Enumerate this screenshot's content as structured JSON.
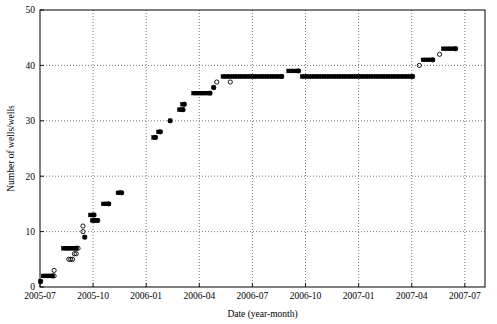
{
  "chart_data": {
    "type": "scatter",
    "title": "",
    "xlabel": "Date (year-month)",
    "ylabel": "Number of wells/wells",
    "ylim": [
      0,
      50
    ],
    "yticks": [
      0,
      10,
      20,
      30,
      40,
      50
    ],
    "ytick_labels": [
      "0",
      "10",
      "20",
      "30",
      "40",
      "50"
    ],
    "xlim": [
      "2005-07",
      "2007-08"
    ],
    "xticks": [
      "2005-07",
      "2005-10",
      "2006-01",
      "2006-04",
      "2006-07",
      "2006-10",
      "2007-01",
      "2007-04",
      "2007-07"
    ],
    "xtick_labels": [
      "2005-07",
      "2005-10",
      "2006-01",
      "2006-04",
      "2006-07",
      "2006-10",
      "2007-01",
      "2007-04",
      "2007-07"
    ],
    "grid": true,
    "grid_style": "dotted",
    "marker_filled": "square",
    "marker_open": "circle",
    "series": [
      {
        "name": "wells-filled-square",
        "marker": "filled-square",
        "color": "#000000",
        "points": [
          {
            "x": 0.2,
            "y": 1
          },
          {
            "x": 1.0,
            "y": 2
          },
          {
            "x": 1.6,
            "y": 2
          },
          {
            "x": 2.2,
            "y": 2
          },
          {
            "x": 2.8,
            "y": 2
          },
          {
            "x": 3.4,
            "y": 2
          },
          {
            "x": 4.0,
            "y": 2
          },
          {
            "x": 7.6,
            "y": 7
          },
          {
            "x": 8.2,
            "y": 7
          },
          {
            "x": 8.8,
            "y": 7
          },
          {
            "x": 9.4,
            "y": 7
          },
          {
            "x": 10.0,
            "y": 7
          },
          {
            "x": 10.6,
            "y": 7
          },
          {
            "x": 11.2,
            "y": 7
          },
          {
            "x": 11.8,
            "y": 7
          },
          {
            "x": 14.6,
            "y": 9
          },
          {
            "x": 17.0,
            "y": 12
          },
          {
            "x": 17.6,
            "y": 12
          },
          {
            "x": 18.2,
            "y": 12
          },
          {
            "x": 18.8,
            "y": 12
          },
          {
            "x": 16.4,
            "y": 13
          },
          {
            "x": 17.0,
            "y": 13
          },
          {
            "x": 17.6,
            "y": 13
          },
          {
            "x": 20.6,
            "y": 15
          },
          {
            "x": 21.2,
            "y": 15
          },
          {
            "x": 21.8,
            "y": 15
          },
          {
            "x": 22.4,
            "y": 15
          },
          {
            "x": 25.4,
            "y": 17
          },
          {
            "x": 26.0,
            "y": 17
          },
          {
            "x": 26.6,
            "y": 17
          },
          {
            "x": 37.0,
            "y": 27
          },
          {
            "x": 37.6,
            "y": 27
          },
          {
            "x": 38.6,
            "y": 28
          },
          {
            "x": 39.2,
            "y": 28
          },
          {
            "x": 42.4,
            "y": 30
          },
          {
            "x": 45.4,
            "y": 32
          },
          {
            "x": 46.0,
            "y": 32
          },
          {
            "x": 46.6,
            "y": 32
          },
          {
            "x": 46.4,
            "y": 33
          },
          {
            "x": 47.0,
            "y": 33
          },
          {
            "x": 50.0,
            "y": 35
          },
          {
            "x": 50.6,
            "y": 35
          },
          {
            "x": 51.2,
            "y": 35
          },
          {
            "x": 51.8,
            "y": 35
          },
          {
            "x": 52.4,
            "y": 35
          },
          {
            "x": 53.0,
            "y": 35
          },
          {
            "x": 53.6,
            "y": 35
          },
          {
            "x": 54.2,
            "y": 35
          },
          {
            "x": 54.8,
            "y": 35
          },
          {
            "x": 55.4,
            "y": 35
          },
          {
            "x": 56.6,
            "y": 36
          },
          {
            "x": 59.6,
            "y": 38
          },
          {
            "x": 60.4,
            "y": 38
          },
          {
            "x": 61.2,
            "y": 38
          },
          {
            "x": 62.0,
            "y": 38
          },
          {
            "x": 62.8,
            "y": 38
          },
          {
            "x": 63.6,
            "y": 38
          },
          {
            "x": 64.4,
            "y": 38
          },
          {
            "x": 65.2,
            "y": 38
          },
          {
            "x": 66.0,
            "y": 38
          },
          {
            "x": 66.8,
            "y": 38
          },
          {
            "x": 67.6,
            "y": 38
          },
          {
            "x": 68.4,
            "y": 38
          },
          {
            "x": 69.2,
            "y": 38
          },
          {
            "x": 70.0,
            "y": 38
          },
          {
            "x": 70.8,
            "y": 38
          },
          {
            "x": 71.6,
            "y": 38
          },
          {
            "x": 72.4,
            "y": 38
          },
          {
            "x": 73.2,
            "y": 38
          },
          {
            "x": 74.0,
            "y": 38
          },
          {
            "x": 74.8,
            "y": 38
          },
          {
            "x": 75.6,
            "y": 38
          },
          {
            "x": 76.4,
            "y": 38
          },
          {
            "x": 77.2,
            "y": 38
          },
          {
            "x": 78.0,
            "y": 38
          },
          {
            "x": 78.8,
            "y": 38
          },
          {
            "x": 81.0,
            "y": 39
          },
          {
            "x": 81.8,
            "y": 39
          },
          {
            "x": 82.6,
            "y": 39
          },
          {
            "x": 83.4,
            "y": 39
          },
          {
            "x": 84.2,
            "y": 39
          },
          {
            "x": 85.4,
            "y": 38
          },
          {
            "x": 86.2,
            "y": 38
          },
          {
            "x": 87.0,
            "y": 38
          },
          {
            "x": 87.8,
            "y": 38
          },
          {
            "x": 88.6,
            "y": 38
          },
          {
            "x": 89.4,
            "y": 38
          },
          {
            "x": 90.2,
            "y": 38
          },
          {
            "x": 91.0,
            "y": 38
          },
          {
            "x": 91.8,
            "y": 38
          },
          {
            "x": 92.6,
            "y": 38
          },
          {
            "x": 93.4,
            "y": 38
          },
          {
            "x": 94.2,
            "y": 38
          },
          {
            "x": 95.0,
            "y": 38
          },
          {
            "x": 95.8,
            "y": 38
          },
          {
            "x": 96.6,
            "y": 38
          },
          {
            "x": 97.4,
            "y": 38
          },
          {
            "x": 98.2,
            "y": 38
          },
          {
            "x": 99.0,
            "y": 38
          },
          {
            "x": 99.8,
            "y": 38
          },
          {
            "x": 100.6,
            "y": 38
          },
          {
            "x": 101.4,
            "y": 38
          },
          {
            "x": 102.2,
            "y": 38
          },
          {
            "x": 103.0,
            "y": 38
          },
          {
            "x": 103.8,
            "y": 38
          },
          {
            "x": 104.6,
            "y": 38
          },
          {
            "x": 105.4,
            "y": 38
          },
          {
            "x": 106.2,
            "y": 38
          },
          {
            "x": 107.0,
            "y": 38
          },
          {
            "x": 107.8,
            "y": 38
          },
          {
            "x": 108.6,
            "y": 38
          },
          {
            "x": 109.4,
            "y": 38
          },
          {
            "x": 110.2,
            "y": 38
          },
          {
            "x": 111.0,
            "y": 38
          },
          {
            "x": 111.8,
            "y": 38
          },
          {
            "x": 112.6,
            "y": 38
          },
          {
            "x": 113.4,
            "y": 38
          },
          {
            "x": 114.2,
            "y": 38
          },
          {
            "x": 115.0,
            "y": 38
          },
          {
            "x": 115.8,
            "y": 38
          },
          {
            "x": 116.6,
            "y": 38
          },
          {
            "x": 117.4,
            "y": 38
          },
          {
            "x": 118.2,
            "y": 38
          },
          {
            "x": 119.0,
            "y": 38
          },
          {
            "x": 119.8,
            "y": 38
          },
          {
            "x": 120.6,
            "y": 38
          },
          {
            "x": 121.4,
            "y": 38
          },
          {
            "x": 124.8,
            "y": 41
          },
          {
            "x": 125.6,
            "y": 41
          },
          {
            "x": 126.4,
            "y": 41
          },
          {
            "x": 127.2,
            "y": 41
          },
          {
            "x": 128.0,
            "y": 41
          },
          {
            "x": 131.4,
            "y": 43
          },
          {
            "x": 132.2,
            "y": 43
          },
          {
            "x": 133.0,
            "y": 43
          },
          {
            "x": 133.8,
            "y": 43
          },
          {
            "x": 134.6,
            "y": 43
          },
          {
            "x": 135.4,
            "y": 43
          }
        ]
      },
      {
        "name": "wells-open-circle",
        "marker": "open-circle",
        "color": "#000000",
        "points": [
          {
            "x": 0.2,
            "y": 1
          },
          {
            "x": 4.0,
            "y": 2
          },
          {
            "x": 4.6,
            "y": 2
          },
          {
            "x": 4.6,
            "y": 3
          },
          {
            "x": 11.8,
            "y": 7
          },
          {
            "x": 12.4,
            "y": 7
          },
          {
            "x": 11.2,
            "y": 6
          },
          {
            "x": 11.8,
            "y": 6
          },
          {
            "x": 9.4,
            "y": 5
          },
          {
            "x": 10.0,
            "y": 5
          },
          {
            "x": 10.6,
            "y": 5
          },
          {
            "x": 14.6,
            "y": 9
          },
          {
            "x": 14.0,
            "y": 10
          },
          {
            "x": 14.0,
            "y": 11
          },
          {
            "x": 18.8,
            "y": 12
          },
          {
            "x": 17.6,
            "y": 13
          },
          {
            "x": 22.4,
            "y": 15
          },
          {
            "x": 26.6,
            "y": 17
          },
          {
            "x": 37.6,
            "y": 27
          },
          {
            "x": 39.2,
            "y": 28
          },
          {
            "x": 42.4,
            "y": 30
          },
          {
            "x": 46.6,
            "y": 32
          },
          {
            "x": 47.0,
            "y": 33
          },
          {
            "x": 55.4,
            "y": 35
          },
          {
            "x": 56.6,
            "y": 36
          },
          {
            "x": 57.6,
            "y": 37
          },
          {
            "x": 62.0,
            "y": 37
          },
          {
            "x": 78.8,
            "y": 38
          },
          {
            "x": 84.2,
            "y": 39
          },
          {
            "x": 121.4,
            "y": 38
          },
          {
            "x": 123.6,
            "y": 40
          },
          {
            "x": 128.0,
            "y": 41
          },
          {
            "x": 130.2,
            "y": 42
          },
          {
            "x": 135.4,
            "y": 43
          }
        ]
      }
    ]
  }
}
